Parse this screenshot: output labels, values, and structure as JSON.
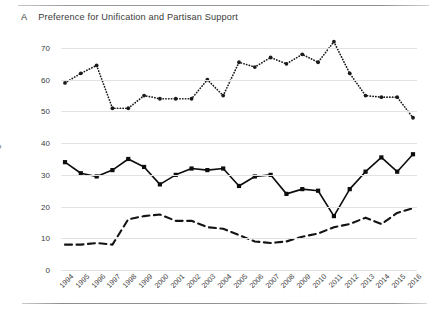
{
  "figure": {
    "label": "A",
    "caption": "Preference for Unification and Partisan Support",
    "divider_color": "#8f8f8f"
  },
  "axes": {
    "ylabel": "Percentage",
    "ytick_labels": [
      "70",
      "60",
      "50",
      "40",
      "30",
      "20",
      "10",
      "0"
    ],
    "ylim": [
      0,
      70
    ],
    "xlabel": ""
  },
  "chart_data": {
    "type": "line",
    "title": "Preference for Unification and Partisan Support",
    "xlabel": "",
    "ylabel": "Percentage",
    "ylim": [
      0,
      70
    ],
    "yticks": [
      0,
      10,
      20,
      30,
      40,
      50,
      60,
      70
    ],
    "grid": true,
    "legend": "none",
    "categories": [
      "1994",
      "1995",
      "1996",
      "1997",
      "1998",
      "1999",
      "2000",
      "2001",
      "2002",
      "2003",
      "2004",
      "2005",
      "2006",
      "2007",
      "2008",
      "2009",
      "2010",
      "2011",
      "2012",
      "2013",
      "2014",
      "2015",
      "2016"
    ],
    "series": [
      {
        "name": "series-top-dotted",
        "style": "dotted",
        "marker": "circle",
        "color": "#1a1a1a",
        "values": [
          59,
          62,
          64.5,
          51,
          51,
          55,
          54,
          54,
          54,
          60,
          55,
          65.5,
          64,
          67,
          65,
          68,
          65.5,
          72,
          62,
          55,
          54.5,
          54.5,
          48
        ]
      },
      {
        "name": "series-middle-solid",
        "style": "solid",
        "marker": "square",
        "color": "#0d0d0d",
        "values": [
          34,
          30.5,
          29.5,
          31.5,
          35,
          32.5,
          27,
          30,
          32,
          31.5,
          32,
          26.5,
          29.5,
          30,
          24,
          25.5,
          25,
          17,
          25.5,
          31,
          35.5,
          31,
          36.5
        ]
      },
      {
        "name": "series-bottom-dashed",
        "style": "dashed",
        "marker": "none",
        "color": "#141414",
        "values": [
          8,
          8,
          8.5,
          8,
          16,
          17,
          17.5,
          15.5,
          15.5,
          13.5,
          13,
          11,
          9,
          8.5,
          9,
          10.5,
          11.5,
          13.5,
          14.5,
          16.5,
          14.5,
          18,
          19.5
        ]
      }
    ]
  }
}
